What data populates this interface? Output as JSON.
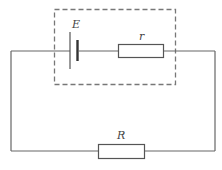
{
  "diagram": {
    "type": "circuit",
    "components": [
      {
        "id": "battery",
        "label": "E",
        "kind": "cell"
      },
      {
        "id": "internal-resistor",
        "label": "r",
        "kind": "resistor"
      },
      {
        "id": "external-resistor",
        "label": "R",
        "kind": "resistor"
      }
    ],
    "enclosure": {
      "style": "dashed",
      "contains": [
        "E",
        "r"
      ]
    },
    "colors": {
      "wire": "#666666",
      "dashed": "#777777",
      "text": "#444444"
    }
  },
  "labels": {
    "emf": "E",
    "internal_resistance": "r",
    "external_resistance": "R"
  }
}
